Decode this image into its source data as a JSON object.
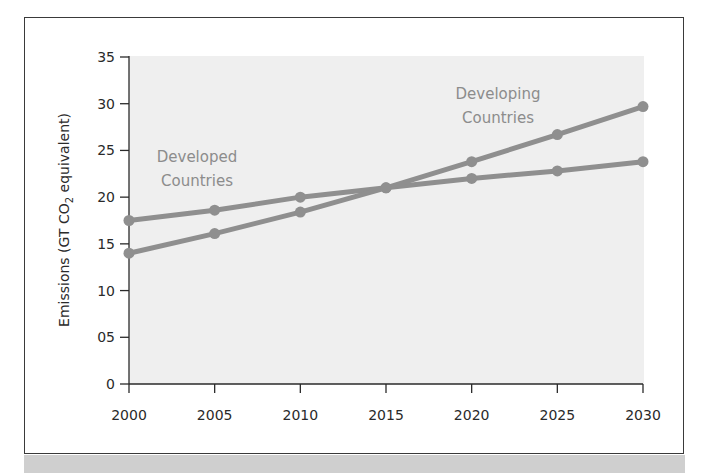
{
  "chart_data": {
    "type": "line",
    "title": "",
    "xlabel": "",
    "ylabel": "Emissions (GT CO2 equivalent)",
    "ylabel_parts": {
      "prefix": "Emissions (GT CO",
      "subscript": "2",
      "suffix": " equivalent)"
    },
    "x": [
      2000,
      2005,
      2010,
      2015,
      2020,
      2025,
      2030
    ],
    "x_tick_labels": [
      "2000",
      "2005",
      "2010",
      "2015",
      "2020",
      "2025",
      "2030"
    ],
    "y_ticks": [
      0,
      5,
      10,
      15,
      20,
      25,
      30,
      35
    ],
    "y_tick_labels": [
      "0",
      "05",
      "10",
      "15",
      "20",
      "25",
      "30",
      "35"
    ],
    "ylim": [
      0,
      35
    ],
    "xlim": [
      2000,
      2030
    ],
    "grid": false,
    "legend": "inline labels",
    "series": [
      {
        "name": "Developed Countries",
        "label_lines": [
          "Developed",
          "Countries"
        ],
        "values": [
          17.5,
          18.6,
          20.0,
          21.0,
          22.0,
          22.8,
          23.8
        ]
      },
      {
        "name": "Developing Countries",
        "label_lines": [
          "Developing",
          "Countries"
        ],
        "values": [
          14.0,
          16.1,
          18.4,
          21.0,
          23.8,
          26.7,
          29.7
        ]
      }
    ],
    "colors": {
      "plot_background": "#efefef",
      "line": "#8f8f8f",
      "label": "#8c8c8c",
      "axis": "#2a2a2a"
    }
  }
}
